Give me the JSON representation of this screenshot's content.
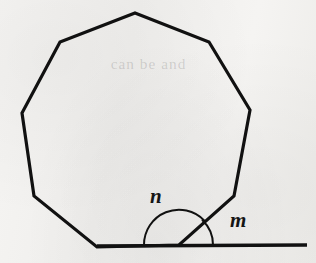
{
  "figure": {
    "name": "nonagon-exterior-angle-diagram",
    "type": "geometry-diagram",
    "background_color": "#f4f3f1",
    "ink_color": "#111111",
    "canvas": {
      "width": 316,
      "height": 263
    },
    "bleed_through_text": "can be and",
    "labels": [
      {
        "id": "n",
        "text": "n",
        "x": 158,
        "y": 197,
        "style": "italic-serif"
      },
      {
        "id": "m",
        "text": "m",
        "x": 238,
        "y": 221,
        "style": "italic-serif"
      }
    ],
    "polygon": {
      "sides": 9,
      "stroke_width": 3.2,
      "points": "135,13 209,42 250,110 234,196 179,245 97,247 34,196 22,113 60,42",
      "vertices": [
        {
          "label": "top-apex",
          "x": 135,
          "y": 13
        },
        {
          "label": "upper-right",
          "x": 209,
          "y": 42
        },
        {
          "label": "right-upper",
          "x": 250,
          "y": 110
        },
        {
          "label": "right-lower",
          "x": 234,
          "y": 196
        },
        {
          "label": "baseline-right",
          "x": 179,
          "y": 245
        },
        {
          "label": "baseline-left",
          "x": 97,
          "y": 247
        },
        {
          "label": "left-lower",
          "x": 34,
          "y": 196
        },
        {
          "label": "left-upper",
          "x": 22,
          "y": 113
        },
        {
          "label": "upper-left",
          "x": 60,
          "y": 42
        }
      ]
    },
    "baseline": {
      "name": "horizontal-extension-line",
      "stroke_width": 3.4,
      "x1": 97,
      "y1": 246,
      "x2": 307,
      "y2": 245
    },
    "arcs": [
      {
        "id": "arc-n",
        "for_label": "n",
        "center_x": 179,
        "center_y": 245,
        "radius": 35,
        "stroke_width": 2.0,
        "path": "M 144 245 A 35 35 0 0 1 204.4 220.6"
      },
      {
        "id": "arc-m",
        "for_label": "m",
        "center_x": 179,
        "center_y": 245,
        "radius": 34,
        "stroke_width": 2.0,
        "path": "M 202.5 220.3 A 34 34 0 0 1 213 245"
      }
    ]
  }
}
